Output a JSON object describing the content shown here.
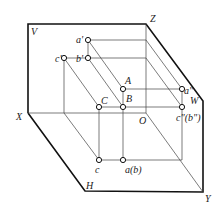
{
  "diagram": {
    "type": "three-plane orthographic projection",
    "planes": {
      "V": "V",
      "H": "H",
      "W": "W"
    },
    "axes": {
      "X": "X",
      "Y": "Y",
      "Z": "Z",
      "O": "O"
    },
    "points": {
      "A": "A",
      "B": "B",
      "C": "C",
      "a_prime": "a'",
      "b_prime": "b'",
      "c_prime": "c'",
      "a_double": "a\"",
      "cb_double": "c\"(b\")",
      "c_h": "c",
      "ab_h": "a(b)"
    }
  }
}
